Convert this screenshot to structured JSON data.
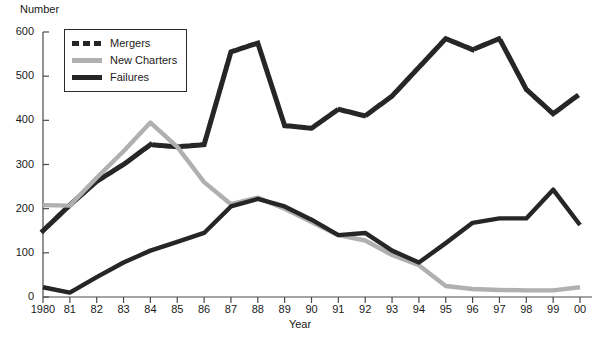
{
  "chart_data": {
    "type": "line",
    "title": "",
    "xlabel": "Year",
    "ylabel": "Number",
    "x": [
      "1980",
      "81",
      "82",
      "83",
      "84",
      "85",
      "86",
      "87",
      "88",
      "89",
      "90",
      "91",
      "92",
      "93",
      "94",
      "95",
      "96",
      "97",
      "98",
      "99",
      "00"
    ],
    "xlim": [
      0,
      20
    ],
    "ylim": [
      0,
      600
    ],
    "yticks": [
      0,
      100,
      200,
      300,
      400,
      500,
      600
    ],
    "grid": false,
    "legend_position": "top-left-inside",
    "series": [
      {
        "name": "Mergers",
        "style": "dotted",
        "color": "#262626",
        "values": [
          150,
          208,
          262,
          300,
          345,
          340,
          345,
          555,
          575,
          388,
          382,
          425,
          410,
          455,
          520,
          585,
          560,
          585,
          470,
          415,
          460
        ]
      },
      {
        "name": "New Charters",
        "style": "solid",
        "color": "#b0b0b0",
        "values": [
          208,
          207,
          270,
          330,
          395,
          340,
          260,
          210,
          225,
          200,
          170,
          140,
          128,
          95,
          72,
          25,
          18,
          16,
          15,
          15,
          22
        ]
      },
      {
        "name": "Failures",
        "style": "solid",
        "color": "#262626",
        "values": [
          22,
          10,
          45,
          78,
          105,
          125,
          145,
          205,
          222,
          205,
          175,
          140,
          145,
          105,
          78,
          122,
          168,
          178,
          178,
          243,
          163
        ]
      }
    ]
  },
  "legend": {
    "items": [
      {
        "label": "Mergers",
        "swatch": "dotted-dark"
      },
      {
        "label": "New Charters",
        "swatch": "solid-gray"
      },
      {
        "label": "Failures",
        "swatch": "solid-dark"
      }
    ]
  },
  "axes": {
    "y_title": "Number",
    "x_title": "Year",
    "y_tick_labels": [
      "600",
      "500",
      "400",
      "300",
      "200",
      "100",
      "0"
    ],
    "x_tick_labels": [
      "1980",
      "81",
      "82",
      "83",
      "84",
      "85",
      "86",
      "87",
      "88",
      "89",
      "90",
      "91",
      "92",
      "93",
      "94",
      "95",
      "96",
      "97",
      "98",
      "99",
      "00"
    ]
  },
  "colors": {
    "series_dark": "#262626",
    "series_gray": "#b0b0b0",
    "axis": "#4a4a4a",
    "background": "#ffffff"
  }
}
